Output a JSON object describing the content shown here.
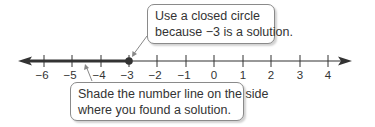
{
  "number_line": {
    "min": -6,
    "max": 4,
    "ticks": [
      "−6",
      "−5",
      "−4",
      "−3",
      "−2",
      "−1",
      "0",
      "1",
      "2",
      "3",
      "4"
    ],
    "closed_point": -3,
    "shaded_direction": "left",
    "line_color": "#333333"
  },
  "callouts": {
    "top": {
      "line1": "Use a closed circle",
      "line2": "because −3 is a solution."
    },
    "bottom": {
      "line1": "Shade the number line on the side",
      "line2": "where you found a solution."
    }
  }
}
